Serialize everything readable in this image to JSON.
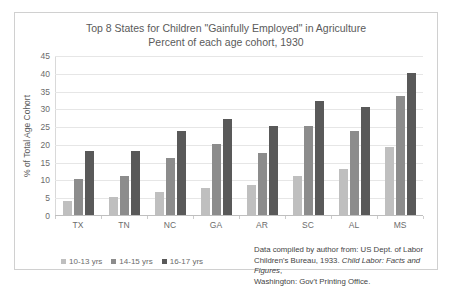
{
  "chart_data": {
    "type": "bar",
    "title": "Top 8 States for Children \"Gainfully Employed\" in Agriculture",
    "subtitle": "Percent of each age cohort, 1930",
    "xlabel": "",
    "ylabel": "% of Total Age Cohort",
    "ylim": [
      0,
      45
    ],
    "ytick_step": 5,
    "yticks": [
      45,
      40,
      35,
      30,
      25,
      20,
      15,
      10,
      5,
      0
    ],
    "grid": true,
    "legend_position": "bottom-left",
    "categories": [
      "TX",
      "TN",
      "NC",
      "GA",
      "AR",
      "SC",
      "AL",
      "MS"
    ],
    "series": [
      {
        "name": "10-13 yrs",
        "color": "#bfbfbf",
        "values": [
          4,
          5,
          6.5,
          7.5,
          8.5,
          11,
          13,
          19
        ]
      },
      {
        "name": "14-15 yrs",
        "color": "#8c8c8c",
        "values": [
          10,
          11,
          16,
          20,
          17.5,
          25,
          23.5,
          33.5
        ]
      },
      {
        "name": "16-17 yrs",
        "color": "#595959",
        "values": [
          18,
          18,
          23.5,
          27,
          25,
          32,
          30.5,
          40
        ]
      }
    ]
  },
  "source_note": {
    "line1_prefix": "Data compiled by author from: US Dept. of Labor",
    "line2_prefix": "Children's Bureau, 1933. ",
    "line2_italic": "Child Labor: Facts and Figures",
    "line2_suffix": ",",
    "line3": "Washington: Gov't Printing Office."
  }
}
